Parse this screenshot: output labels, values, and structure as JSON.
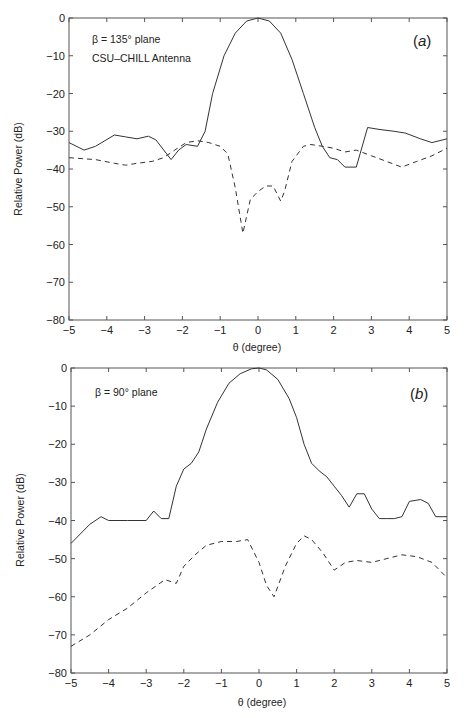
{
  "chart_data": [
    {
      "type": "line",
      "panel_label": "(a)",
      "annotations": [
        "β = 135° plane",
        "CSU–CHILL Antenna"
      ],
      "xlabel": "θ (degree)",
      "ylabel": "Relative Power (dB)",
      "xlim": [
        -5,
        5
      ],
      "ylim": [
        -80,
        0
      ],
      "xticks": [
        -5,
        -4,
        -3,
        -2,
        -1,
        0,
        1,
        2,
        3,
        4,
        5
      ],
      "yticks": [
        0,
        -10,
        -20,
        -30,
        -40,
        -50,
        -60,
        -70,
        -80
      ],
      "grid": false,
      "series": [
        {
          "name": "co-polar",
          "style": "solid",
          "x": [
            -5,
            -4.6,
            -4.3,
            -3.8,
            -3.5,
            -3.2,
            -2.9,
            -2.7,
            -2.3,
            -2.1,
            -1.9,
            -1.6,
            -1.4,
            -1.2,
            -0.9,
            -0.6,
            -0.3,
            0,
            0.3,
            0.6,
            0.9,
            1.2,
            1.5,
            1.7,
            1.9,
            2.1,
            2.3,
            2.6,
            2.9,
            3.2,
            3.6,
            3.9,
            4.3,
            4.6,
            5
          ],
          "y": [
            -33,
            -35,
            -34,
            -31,
            -31.5,
            -32,
            -31.3,
            -32.3,
            -37.5,
            -35,
            -33.5,
            -34,
            -30,
            -20,
            -10,
            -4,
            -0.8,
            0,
            -0.8,
            -4,
            -11,
            -20,
            -29,
            -34,
            -37,
            -37.5,
            -39.5,
            -39.5,
            -29,
            -29.5,
            -30,
            -30.5,
            -32,
            -33,
            -32
          ]
        },
        {
          "name": "cross-polar",
          "style": "dashed",
          "x": [
            -5,
            -4.3,
            -3.8,
            -3.5,
            -3.2,
            -2.8,
            -2.5,
            -2.2,
            -1.9,
            -1.6,
            -1.3,
            -1.0,
            -0.8,
            -0.6,
            -0.4,
            -0.2,
            0,
            0.2,
            0.4,
            0.6,
            0.7,
            0.9,
            1.2,
            1.4,
            1.7,
            2.0,
            2.3,
            2.6,
            3.0,
            3.4,
            3.8,
            4.2,
            4.6,
            5
          ],
          "y": [
            -37,
            -37.5,
            -38.5,
            -39,
            -38.5,
            -38,
            -37,
            -35,
            -33,
            -32.5,
            -33,
            -34,
            -36,
            -45,
            -57,
            -48,
            -46,
            -44.5,
            -44.5,
            -48.5,
            -46,
            -38,
            -34,
            -33.5,
            -34,
            -34.5,
            -35.5,
            -35,
            -36.5,
            -38,
            -39.5,
            -38,
            -36.5,
            -34.5
          ]
        }
      ]
    },
    {
      "type": "line",
      "panel_label": "(b)",
      "annotations": [
        "β = 90° plane"
      ],
      "xlabel": "θ (degree)",
      "ylabel": "Relative Power (dB)",
      "xlim": [
        -5,
        5
      ],
      "ylim": [
        -80,
        0
      ],
      "xticks": [
        -5,
        -4,
        -3,
        -2,
        -1,
        0,
        1,
        2,
        3,
        4,
        5
      ],
      "yticks": [
        0,
        -10,
        -20,
        -30,
        -40,
        -50,
        -60,
        -70,
        -80
      ],
      "grid": false,
      "series": [
        {
          "name": "co-polar",
          "style": "solid",
          "x": [
            -5,
            -4.5,
            -4.2,
            -4.0,
            -3.5,
            -3.0,
            -2.8,
            -2.6,
            -2.4,
            -2.2,
            -2.0,
            -1.8,
            -1.6,
            -1.4,
            -1.1,
            -0.8,
            -0.5,
            -0.2,
            0,
            0.2,
            0.5,
            0.8,
            1.0,
            1.2,
            1.4,
            1.6,
            1.8,
            2.0,
            2.2,
            2.4,
            2.6,
            2.8,
            3.0,
            3.2,
            3.4,
            3.6,
            3.8,
            4.0,
            4.3,
            4.5,
            4.7,
            5
          ],
          "y": [
            -46,
            -41,
            -39,
            -40,
            -40,
            -40,
            -37.5,
            -39.5,
            -39.5,
            -31,
            -26.5,
            -25,
            -22,
            -16,
            -9,
            -4,
            -1.5,
            -0.2,
            0,
            -0.5,
            -3,
            -8,
            -13,
            -20,
            -25,
            -27,
            -28.5,
            -31,
            -33.5,
            -36.5,
            -33,
            -33,
            -37,
            -39.5,
            -39.5,
            -39.5,
            -39,
            -35,
            -34.5,
            -35.5,
            -39,
            -39
          ]
        },
        {
          "name": "cross-polar",
          "style": "dashed",
          "x": [
            -5,
            -4.5,
            -4.0,
            -3.5,
            -3.0,
            -2.5,
            -2.2,
            -2.0,
            -1.7,
            -1.4,
            -1.0,
            -0.6,
            -0.3,
            0,
            0.2,
            0.4,
            0.7,
            1.0,
            1.2,
            1.4,
            1.7,
            2.0,
            2.3,
            2.6,
            3.0,
            3.4,
            3.8,
            4.2,
            4.6,
            5
          ],
          "y": [
            -73,
            -70,
            -66,
            -63,
            -59,
            -55.5,
            -56.5,
            -52,
            -49,
            -46.5,
            -45.5,
            -45.5,
            -45,
            -51,
            -57,
            -60,
            -52,
            -46,
            -44,
            -45,
            -48.5,
            -53,
            -51,
            -50.5,
            -51,
            -50,
            -49,
            -49.5,
            -51,
            -55
          ]
        }
      ]
    }
  ],
  "plots": {
    "a": {
      "label": "(a)",
      "title_line1": "β = 135° plane",
      "title_line2": "CSU–CHILL Antenna",
      "xlabel": "θ (degree)",
      "ylabel": "Relative Power (dB)"
    },
    "b": {
      "label": "(b)",
      "title_line1": "β = 90° plane",
      "xlabel": "θ (degree)",
      "ylabel": "Relative Power (dB)"
    }
  },
  "colors": {
    "line": "#333333",
    "axis": "#444444",
    "background": "#ffffff"
  }
}
